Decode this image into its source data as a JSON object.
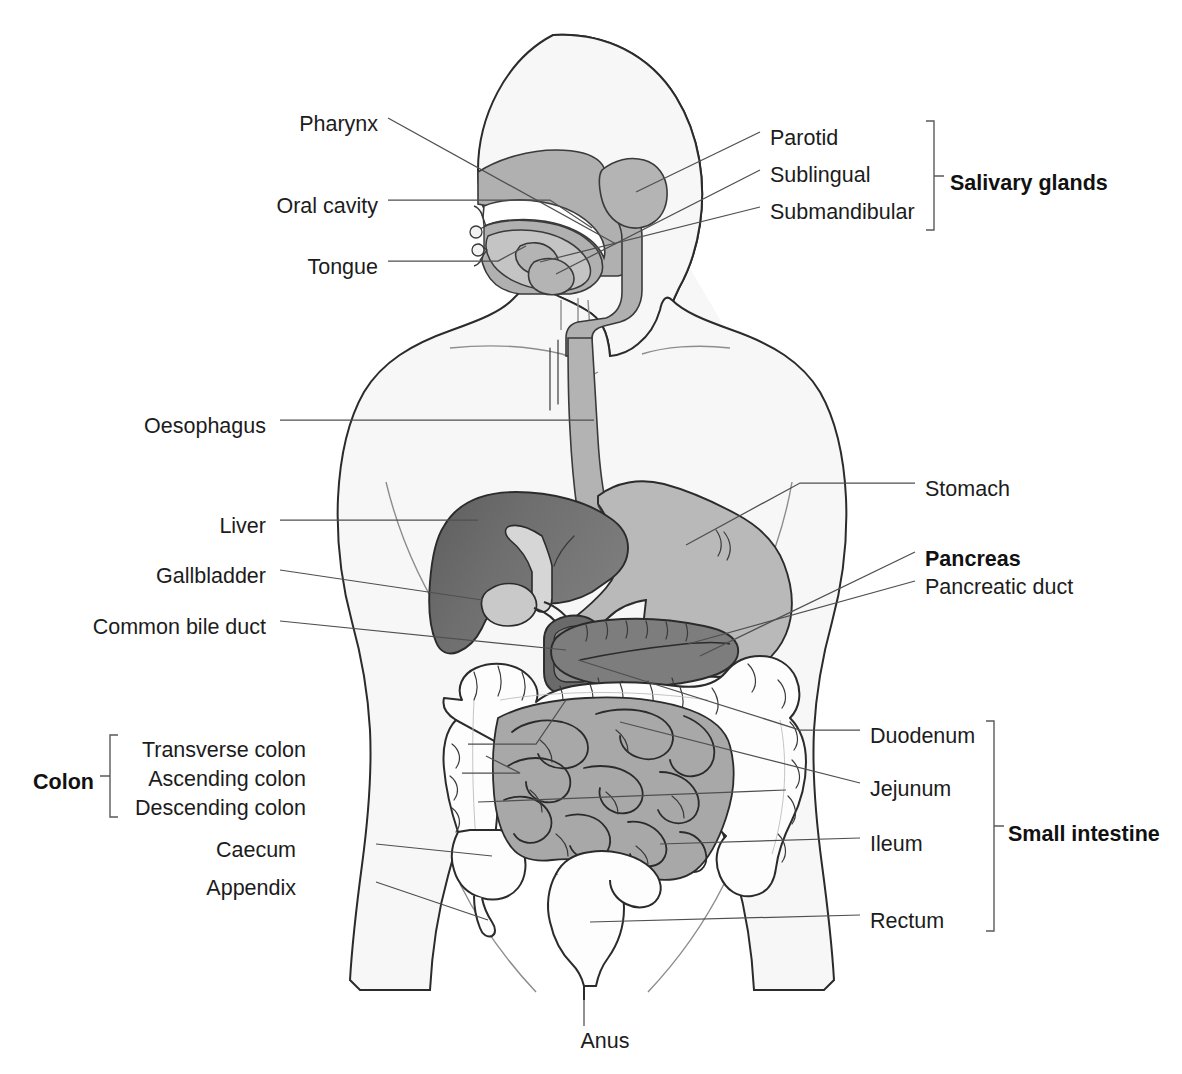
{
  "figure": {
    "background_color": "#ffffff",
    "label_color": "#1c1c1c",
    "leader_color": "#4f4f4f",
    "body_fill": "#f7f7f7",
    "body_stroke": "#2b2b2b"
  },
  "labels_left": [
    {
      "key": "pharynx",
      "text": "Pharynx",
      "x": 378,
      "y": 124
    },
    {
      "key": "oral_cavity",
      "text": "Oral cavity",
      "x": 378,
      "y": 206
    },
    {
      "key": "tongue",
      "text": "Tongue",
      "x": 378,
      "y": 267
    },
    {
      "key": "oesophagus",
      "text": "Oesophagus",
      "x": 260,
      "y": 426
    },
    {
      "key": "liver",
      "text": "Liver",
      "x": 260,
      "y": 526
    },
    {
      "key": "gallbladder",
      "text": "Gallbladder",
      "x": 260,
      "y": 576
    },
    {
      "key": "common_bile_duct",
      "text": "Common bile duct",
      "x": 260,
      "y": 627
    },
    {
      "key": "transverse_colon",
      "text": "Transverse colon",
      "x": 305,
      "y": 750
    },
    {
      "key": "ascending_colon",
      "text": "Ascending colon",
      "x": 305,
      "y": 779
    },
    {
      "key": "descending_colon",
      "text": "Descending colon",
      "x": 305,
      "y": 808
    },
    {
      "key": "caecum",
      "text": "Caecum",
      "x": 295,
      "y": 850
    },
    {
      "key": "appendix",
      "text": "Appendix",
      "x": 295,
      "y": 888
    }
  ],
  "labels_right": [
    {
      "key": "parotid",
      "text": "Parotid",
      "x": 770,
      "y": 138
    },
    {
      "key": "sublingual",
      "text": "Sublingual",
      "x": 770,
      "y": 175
    },
    {
      "key": "submandibular",
      "text": "Submandibular",
      "x": 770,
      "y": 212
    },
    {
      "key": "stomach",
      "text": "Stomach",
      "x": 925,
      "y": 489
    },
    {
      "key": "pancreas",
      "text": "Pancreas",
      "x": 925,
      "y": 558,
      "bold": true
    },
    {
      "key": "pancreatic_duct",
      "text": "Pancreatic duct",
      "x": 925,
      "y": 587
    },
    {
      "key": "duodenum",
      "text": "Duodenum",
      "x": 870,
      "y": 736
    },
    {
      "key": "jejunum",
      "text": "Jejunum",
      "x": 870,
      "y": 789
    },
    {
      "key": "ileum",
      "text": "Ileum",
      "x": 870,
      "y": 844
    },
    {
      "key": "rectum",
      "text": "Rectum",
      "x": 870,
      "y": 921
    }
  ],
  "labels_bottom": [
    {
      "key": "anus",
      "text": "Anus",
      "x": 583,
      "y": 1044
    }
  ],
  "group_labels": [
    {
      "key": "salivary_glands",
      "text": "Salivary glands",
      "x": 950,
      "y": 182,
      "bold": true
    },
    {
      "key": "colon",
      "text": "Colon",
      "x": 33,
      "y": 781,
      "bold": true
    },
    {
      "key": "small_intestine",
      "text": "Small intestine",
      "x": 1006,
      "y": 833,
      "bold": true
    }
  ],
  "brackets": [
    {
      "key": "salivary-glands-bracket",
      "x": 934,
      "y_top": 121,
      "y_bottom": 230,
      "tick_y": 176,
      "side": "right"
    },
    {
      "key": "colon-bracket",
      "x": 110,
      "y_top": 735,
      "y_bottom": 817,
      "tick_y": 776,
      "side": "left"
    },
    {
      "key": "small-intestine-bracket",
      "x": 994,
      "y_top": 721,
      "y_bottom": 931,
      "tick_y": 826,
      "side": "right"
    }
  ],
  "organ_colors": {
    "liver": "#6f6f6f",
    "stomach": "#b9b9b9",
    "pancreas": "#7d7d7d",
    "duodenum": "#6a6a6a",
    "small_intestine": "#a8a8a8",
    "colon": "#fdfdfd",
    "salivary_gland": "#b4b4b4",
    "oral_tissue": "#b0b0b0",
    "oesophagus": "#b3b3b3",
    "gallbladder": "#c9c9c9"
  },
  "organ_names": [
    "head-outline",
    "torso-outline",
    "nasal-cavity",
    "oral-cavity-region",
    "tongue-shape",
    "pharynx-shape",
    "parotid-gland",
    "sublingual-gland",
    "submandibular-gland",
    "oesophagus-shape",
    "stomach-shape",
    "liver-shape",
    "gallbladder-shape",
    "common-bile-duct",
    "pancreas-shape",
    "pancreatic-duct",
    "duodenum-shape",
    "small-intestine-mass",
    "colon-shape",
    "caecum-shape",
    "appendix-shape",
    "rectum-shape",
    "anus-shape"
  ]
}
